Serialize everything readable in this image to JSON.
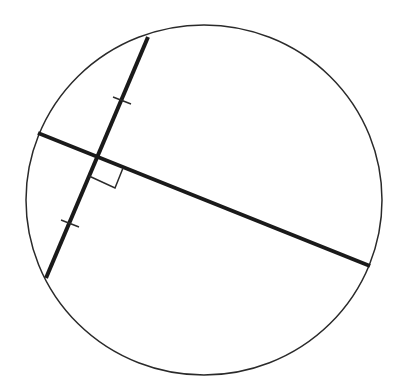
{
  "diagram": {
    "type": "geometry",
    "colors": {
      "stroke": "#2a2a2a",
      "background": "#ffffff"
    },
    "circle": {
      "cx": 204,
      "cy": 200,
      "rx": 178,
      "ry": 175,
      "stroke_width": 1.5
    },
    "chord": {
      "x1": 148,
      "y1": 37,
      "x2": 46,
      "y2": 278,
      "stroke_width": 4
    },
    "bisector": {
      "x1": 38,
      "y1": 133,
      "x2": 370,
      "y2": 266,
      "stroke_width": 4
    },
    "intersection": {
      "x": 97,
      "y": 157
    },
    "right_angle_marker": {
      "points": "89,176 115,188 123,168"
    },
    "tick_marks": [
      {
        "x1": 113,
        "y1": 97,
        "x2": 131,
        "y2": 104
      },
      {
        "x1": 61,
        "y1": 220,
        "x2": 79,
        "y2": 227
      }
    ]
  }
}
